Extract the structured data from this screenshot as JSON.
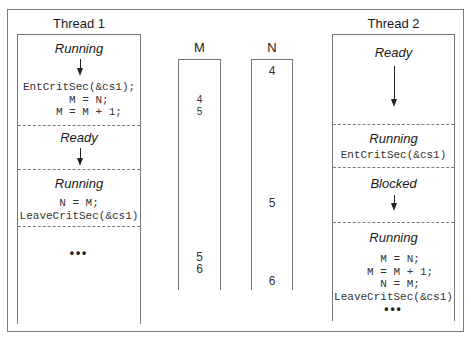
{
  "thread1": {
    "title": "Thread 1",
    "sections": [
      {
        "state": "Running",
        "code": "EntCritSec(&cs1);\n   M = N;\n   M = M + 1;"
      },
      {
        "state": "Ready",
        "code": ""
      },
      {
        "state": "Running",
        "code": "N = M;\nLeaveCritSec(&cs1)"
      },
      {
        "state": "",
        "code": "...",
        "ellipsis": "•••"
      }
    ]
  },
  "thread2": {
    "title": "Thread 2",
    "sections": [
      {
        "state": "Ready",
        "code": ""
      },
      {
        "state": "Running",
        "code": "EntCritSec(&cs1)"
      },
      {
        "state": "Blocked",
        "code": ""
      },
      {
        "state": "Running",
        "code": "  M = N;\n  M = M + 1;\n  N = M;\nLeaveCritSec(&cs1)",
        "ellipsis": "•••"
      }
    ]
  },
  "variables": {
    "M": {
      "label": "M",
      "values": [
        "4",
        "5",
        "5",
        "6"
      ]
    },
    "N": {
      "label": "N",
      "values": [
        "4",
        "5",
        "6"
      ]
    }
  }
}
